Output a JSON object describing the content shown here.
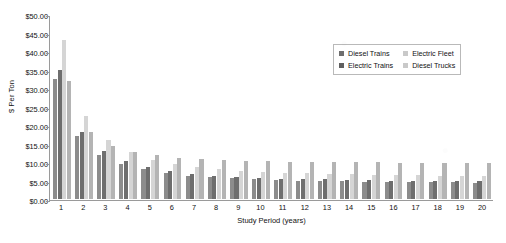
{
  "chart_data": {
    "type": "bar",
    "title": "",
    "xlabel": "Study Period (years)",
    "ylabel": "$ Per Ton",
    "ylim": [
      0,
      50
    ],
    "ytick_labels": [
      "$50.00",
      "$45.00",
      "$40.00",
      "$35.00",
      "$30.00",
      "$25.00",
      "$20.00",
      "$15.00",
      "$10.00",
      "$5.00",
      "$0.00"
    ],
    "ytick_values": [
      50,
      45,
      40,
      35,
      30,
      25,
      20,
      15,
      10,
      5,
      0
    ],
    "grid": false,
    "legend_position": "top-right",
    "categories": [
      "1",
      "2",
      "3",
      "4",
      "5",
      "6",
      "7",
      "8",
      "9",
      "10",
      "11",
      "12",
      "13",
      "14",
      "15",
      "16",
      "17",
      "18",
      "19",
      "20"
    ],
    "series": [
      {
        "name": "Diesel Trains",
        "color": "#8c8c8c",
        "values": [
          32.5,
          17.0,
          12.0,
          9.5,
          8.0,
          7.0,
          6.3,
          5.9,
          5.6,
          5.3,
          5.1,
          5.0,
          4.9,
          4.8,
          4.7,
          4.6,
          4.6,
          4.5,
          4.5,
          4.4
        ]
      },
      {
        "name": "Electric Trains",
        "color": "#6e6e6e",
        "values": [
          35.0,
          18.2,
          13.0,
          10.2,
          8.6,
          7.5,
          6.8,
          6.3,
          6.0,
          5.7,
          5.5,
          5.4,
          5.3,
          5.2,
          5.1,
          5.0,
          5.0,
          4.9,
          4.9,
          4.8
        ]
      },
      {
        "name": "Electric Fleet",
        "color": "#d5d5d5",
        "values": [
          43.0,
          22.5,
          16.0,
          12.6,
          10.6,
          9.4,
          8.6,
          8.0,
          7.6,
          7.3,
          7.1,
          6.9,
          6.8,
          6.7,
          6.6,
          6.5,
          6.4,
          6.3,
          6.3,
          6.2
        ]
      },
      {
        "name": "Diesel Trucks",
        "color": "#b4b4b4",
        "values": [
          32.0,
          18.0,
          14.2,
          12.8,
          11.8,
          11.2,
          10.8,
          10.5,
          10.3,
          10.2,
          10.1,
          10.0,
          10.0,
          9.9,
          9.9,
          9.8,
          9.8,
          9.8,
          9.7,
          9.7
        ]
      }
    ]
  },
  "legend": {
    "items": [
      {
        "label": "Diesel Trains",
        "color": "#6e6e6e"
      },
      {
        "label": "Electric Fleet",
        "color": "#c9c9c9"
      },
      {
        "label": "Electric Trains",
        "color": "#5f5f5f"
      },
      {
        "label": "Diesel Trucks",
        "color": "#c9c9c9"
      }
    ]
  }
}
